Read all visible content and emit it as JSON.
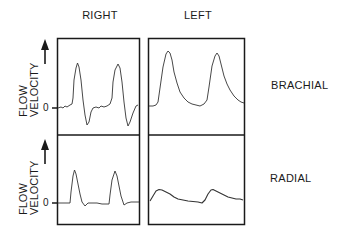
{
  "columns": [
    {
      "label": "RIGHT"
    },
    {
      "label": "LEFT"
    }
  ],
  "rows": [
    {
      "label": "BRACHIAL"
    },
    {
      "label": "RADIAL"
    }
  ],
  "y_axis": {
    "line1": "FLOW",
    "line2": "VELOCITY",
    "arrow": "up-arrow",
    "zero_label": "0"
  },
  "colors": {
    "line": "#222222",
    "frame": "#1a1a1a",
    "background": "#ffffff"
  },
  "waveforms": {
    "brachial_right": "pulsatile, triphasic with reverse flow below zero",
    "brachial_left": "broad peaks, no reverse flow",
    "radial_right": "sharp peaks, brief dip below zero",
    "radial_left": "damped, low amplitude"
  }
}
